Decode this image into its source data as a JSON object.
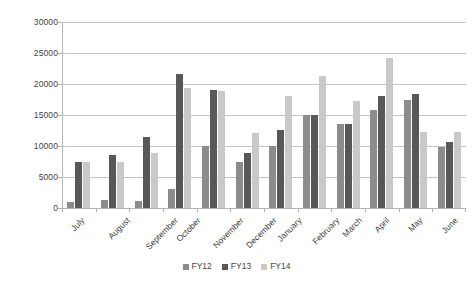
{
  "chart_data": {
    "type": "bar",
    "title": "",
    "subtitle": "",
    "xlabel": "",
    "ylabel": "",
    "ylim": [
      0,
      30000
    ],
    "ytick_step": 5000,
    "yticks": [
      0,
      5000,
      10000,
      15000,
      20000,
      25000,
      30000
    ],
    "ytick_labels": [
      "0",
      "5000",
      "10000",
      "15000",
      "20000",
      "25000",
      "30000"
    ],
    "grid": "horizontal",
    "legend_position": "bottom-center",
    "xtick_rotation": -45,
    "categories": [
      "July",
      "August",
      "September",
      "October",
      "November",
      "December",
      "January",
      "February",
      "March",
      "April",
      "May",
      "June"
    ],
    "series": [
      {
        "name": "FY12",
        "color": "#8c8c8c",
        "values": [
          900,
          1300,
          1200,
          3100,
          10000,
          7500,
          10000,
          15000,
          13600,
          15800,
          17500,
          9800
        ]
      },
      {
        "name": "FY13",
        "color": "#585858",
        "values": [
          7400,
          8600,
          11500,
          21600,
          19000,
          8800,
          12600,
          15000,
          13600,
          18000,
          18400,
          10700
        ]
      },
      {
        "name": "FY14",
        "color": "#c9c9c9",
        "values": [
          7400,
          7400,
          8800,
          19400,
          18800,
          12100,
          18000,
          21300,
          17300,
          24200,
          12200,
          12200
        ]
      }
    ]
  },
  "legend": {
    "items": [
      {
        "label": "FY12",
        "color": "#8c8c8c"
      },
      {
        "label": "FY13",
        "color": "#585858"
      },
      {
        "label": "FY14",
        "color": "#c9c9c9"
      }
    ]
  }
}
